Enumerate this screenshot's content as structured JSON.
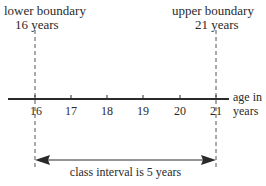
{
  "lower": {
    "title": "lower boundary",
    "value": "16 years"
  },
  "upper": {
    "title": "upper boundary",
    "value": "21 years"
  },
  "axis": {
    "label_line1": "age in",
    "label_line2": "years",
    "ticks": [
      "16",
      "17",
      "18",
      "19",
      "20",
      "21"
    ]
  },
  "interval": {
    "label": "class interval is 5 years"
  },
  "colors": {
    "ink": "#2a2a2a",
    "background": "#ffffff"
  }
}
